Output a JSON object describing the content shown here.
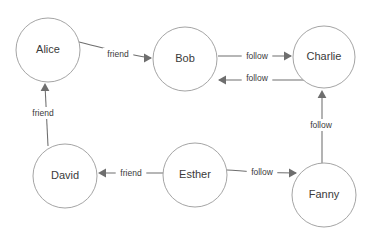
{
  "diagram": {
    "title": "",
    "type": "directed-property-graph",
    "canvas": {
      "width": 371,
      "height": 237,
      "background": "#ffffff"
    },
    "colors": {
      "node_stroke": "#9a9a9a",
      "node_fill": "#ffffff",
      "edge_stroke": "#6e6e6e",
      "text": "#3a3a3a"
    },
    "nodes": [
      {
        "id": "alice",
        "label": "Alice",
        "cx": 48,
        "cy": 50,
        "r": 32
      },
      {
        "id": "bob",
        "label": "Bob",
        "cx": 185,
        "cy": 59,
        "r": 32
      },
      {
        "id": "charlie",
        "label": "Charlie",
        "cx": 324,
        "cy": 57,
        "r": 31
      },
      {
        "id": "david",
        "label": "David",
        "cx": 65,
        "cy": 176,
        "r": 32
      },
      {
        "id": "esther",
        "label": "Esther",
        "cx": 195,
        "cy": 175,
        "r": 32
      },
      {
        "id": "fanny",
        "label": "Fanny",
        "cx": 324,
        "cy": 195,
        "r": 32
      }
    ],
    "edges": [
      {
        "id": "alice-bob",
        "from": "alice",
        "to": "bob",
        "label": "friend",
        "label_x": 118,
        "label_y": 54,
        "path": "M 79 42 C 100 47 122 54 151 58",
        "arrow": "right",
        "arrow_x": 152,
        "arrow_y": 58
      },
      {
        "id": "bob-charlie",
        "from": "bob",
        "to": "charlie",
        "label": "follow",
        "label_x": 257,
        "label_y": 56,
        "path": "M 218 56 L 291 56",
        "arrow": "right",
        "arrow_x": 292,
        "arrow_y": 56
      },
      {
        "id": "charlie-bob",
        "from": "charlie",
        "to": "bob",
        "label": "follow",
        "label_x": 257,
        "label_y": 78,
        "path": "M 316 80 L 219 80",
        "arrow": "left",
        "arrow_x": 218,
        "arrow_y": 80
      },
      {
        "id": "david-alice",
        "from": "david",
        "to": "alice",
        "label": "friend",
        "label_x": 43,
        "label_y": 113,
        "path": "M 48 146 L 45 85",
        "arrow": "up",
        "arrow_x": 45,
        "arrow_y": 83
      },
      {
        "id": "esther-david",
        "from": "esther",
        "to": "david",
        "label": "friend",
        "label_x": 131,
        "label_y": 173,
        "path": "M 163 173 L 100 173",
        "arrow": "left",
        "arrow_x": 98,
        "arrow_y": 173
      },
      {
        "id": "esther-fanny",
        "from": "esther",
        "to": "fanny",
        "label": "follow",
        "label_x": 262,
        "label_y": 172,
        "path": "M 227 170 C 240 170 245 173 296 173",
        "arrow": "right",
        "arrow_x": 297,
        "arrow_y": 173
      },
      {
        "id": "fanny-charlie",
        "from": "fanny",
        "to": "charlie",
        "label": "follow",
        "label_x": 321,
        "label_y": 125,
        "path": "M 322 163 L 322 92",
        "arrow": "up",
        "arrow_x": 322,
        "arrow_y": 90
      }
    ]
  }
}
